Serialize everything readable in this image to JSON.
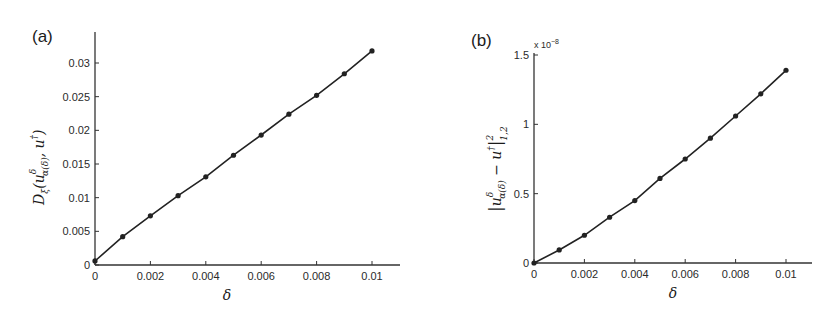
{
  "chart_data": [
    {
      "type": "line",
      "panel_label": "(a)",
      "title": "",
      "xlabel": "δ",
      "ylabel": "D_ξ(u^δ_α(δ), u†)",
      "ylabel_parts": {
        "main": "D",
        "sub_main": "ξ",
        "open": "(",
        "u": "u",
        "sup": "δ",
        "sub": "α(δ)",
        "rest": ", u",
        "dagger": "†",
        "close": ")"
      },
      "x": [
        0,
        0.001,
        0.002,
        0.003,
        0.004,
        0.005,
        0.006,
        0.007,
        0.008,
        0.009,
        0.01
      ],
      "values": [
        0.0006,
        0.0042,
        0.0073,
        0.0103,
        0.0131,
        0.0163,
        0.0193,
        0.0224,
        0.0252,
        0.0284,
        0.0318
      ],
      "xlim": [
        0,
        0.011
      ],
      "ylim": [
        0,
        0.034
      ],
      "xticks": [
        0,
        0.002,
        0.004,
        0.006,
        0.008,
        0.01
      ],
      "xtick_labels": [
        "0",
        "0.002",
        "0.004",
        "0.006",
        "0.008",
        "0.01"
      ],
      "yticks": [
        0,
        0.005,
        0.01,
        0.015,
        0.02,
        0.025,
        0.03
      ],
      "ytick_labels": [
        "0",
        "0.005",
        "0.01",
        "0.015",
        "0.02",
        "0.025",
        "0.03"
      ],
      "grid": false,
      "markers": true,
      "legend": null
    },
    {
      "type": "line",
      "panel_label": "(b)",
      "title": "",
      "xlabel": "δ",
      "ylabel": "|u^δ_α(δ) − u†|²_{1,2}",
      "ylabel_parts": {
        "bar": "|",
        "u": "u",
        "sup": "δ",
        "sub": "α(δ)",
        "minus": " − u",
        "dagger": "†",
        "bar2": "|",
        "pow": "2",
        "norm_sub": "1,2"
      },
      "y_multiplier": "x 10",
      "y_multiplier_exp": "−8",
      "x": [
        0,
        0.001,
        0.002,
        0.003,
        0.004,
        0.005,
        0.006,
        0.007,
        0.008,
        0.009,
        0.01
      ],
      "values": [
        0.0,
        0.094,
        0.2,
        0.33,
        0.45,
        0.61,
        0.75,
        0.9,
        1.06,
        1.22,
        1.39
      ],
      "xlim": [
        0,
        0.011
      ],
      "ylim": [
        0,
        1.5
      ],
      "xticks": [
        0,
        0.002,
        0.004,
        0.006,
        0.008,
        0.01
      ],
      "xtick_labels": [
        "0",
        "0.002",
        "0.004",
        "0.006",
        "0.008",
        "0.01"
      ],
      "yticks": [
        0,
        0.5,
        1,
        1.5
      ],
      "ytick_labels": [
        "0",
        "0.5",
        "1",
        "1.5"
      ],
      "grid": false,
      "markers": true,
      "legend": null
    }
  ],
  "style": {
    "line_color": "#222222",
    "marker_color": "#222222",
    "axis_color": "#333333"
  }
}
